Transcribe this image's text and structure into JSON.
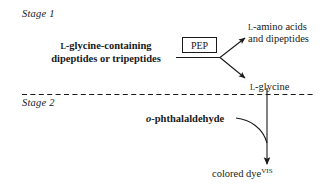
{
  "figure": {
    "type": "reaction-scheme-diagram",
    "width": 331,
    "height": 190,
    "background_color": "#ffffff",
    "ink_color": "#1a1a1a"
  },
  "stages": {
    "stage1": {
      "label": "Stage 1"
    },
    "stage2": {
      "label": "Stage 2"
    }
  },
  "stage1_content": {
    "substrate_line1_prefix": "L",
    "substrate_line1": "-glycine-containing",
    "substrate_line2": "dipeptides or tripeptides",
    "enzyme_box_label": "PEP",
    "product1_prefix": "L",
    "product1_line1": "-amino acids",
    "product1_line2": "and dipeptides",
    "product2_prefix": "L",
    "product2": "-glycine"
  },
  "stage2_content": {
    "reagent_italic_prefix": "o",
    "reagent": "-phthalaldehyde",
    "product": "colored dye",
    "product_superscript": "VIS"
  },
  "divider": {
    "style": "dashed",
    "x_start": 22,
    "x_end": 316,
    "y": 94
  }
}
